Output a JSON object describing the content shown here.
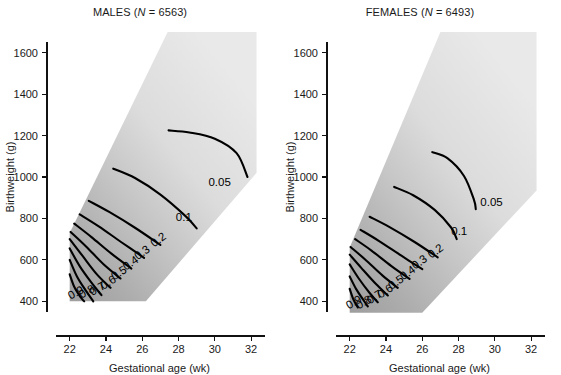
{
  "figure": {
    "background_color": "#ffffff",
    "contour_color": "#000000",
    "axis_color": "#111111"
  },
  "chart_data": [
    {
      "type": "line",
      "title": "MALES (N = 6563)",
      "title_prefix": "MALES (",
      "title_italic": "N",
      "title_suffix": " = 6563)",
      "group": "MALES",
      "n": 6563,
      "xlabel": "Gestational age (wk)",
      "ylabel": "Birthweight (g)",
      "xlim": [
        21.3,
        32.6
      ],
      "ylim": [
        300,
        1700
      ],
      "xticks": [
        22,
        24,
        26,
        28,
        30,
        32
      ],
      "yticks": [
        400,
        600,
        800,
        1000,
        1200,
        1400,
        1600
      ],
      "xticklabels": [
        "22",
        "24",
        "26",
        "28",
        "30",
        "32"
      ],
      "yticklabels": [
        "400",
        "600",
        "800",
        "1000",
        "1200",
        "1400",
        "1600"
      ],
      "grid": false,
      "legend": "none",
      "band_fill": "gradient-gray",
      "band_polygon": [
        [
          22.0,
          400
        ],
        [
          22.0,
          730
        ],
        [
          27.4,
          1700
        ],
        [
          32.3,
          1700
        ],
        [
          32.3,
          1020
        ],
        [
          26.2,
          400
        ]
      ],
      "series": [
        {
          "name": "0.9",
          "label": "0.9",
          "label_x": 22.05,
          "label_y": 408,
          "label_rotation": -28,
          "points": [
            [
              22.0,
              530
            ],
            [
              22.25,
              470
            ],
            [
              22.6,
              420
            ],
            [
              22.8,
              400
            ]
          ]
        },
        {
          "name": "0.8",
          "label": "0.8",
          "label_x": 22.65,
          "label_y": 412,
          "label_rotation": -28,
          "points": [
            [
              22.0,
              600
            ],
            [
              22.4,
              520
            ],
            [
              22.9,
              450
            ],
            [
              23.3,
              400
            ]
          ]
        },
        {
          "name": "0.7",
          "label": "0.7",
          "label_x": 23.25,
          "label_y": 425,
          "label_rotation": -30,
          "points": [
            [
              22.0,
              655
            ],
            [
              22.55,
              570
            ],
            [
              23.2,
              490
            ],
            [
              23.75,
              430
            ]
          ]
        },
        {
          "name": "0.6",
          "label": "0.6",
          "label_x": 23.85,
          "label_y": 455,
          "label_rotation": -32,
          "points": [
            [
              22.0,
              700
            ],
            [
              22.7,
              620
            ],
            [
              23.5,
              530
            ],
            [
              24.25,
              465
            ]
          ]
        },
        {
          "name": "0.5",
          "label": "0.5",
          "label_x": 24.45,
          "label_y": 500,
          "label_rotation": -33,
          "points": [
            [
              22.05,
              735
            ],
            [
              22.9,
              665
            ],
            [
              23.85,
              580
            ],
            [
              24.8,
              510
            ]
          ]
        },
        {
          "name": "0.4",
          "label": "0.4",
          "label_x": 25.1,
          "label_y": 548,
          "label_rotation": -34,
          "points": [
            [
              22.25,
              775
            ],
            [
              23.2,
              710
            ],
            [
              24.3,
              630
            ],
            [
              25.4,
              558
            ]
          ]
        },
        {
          "name": "0.3",
          "label": "0.3",
          "label_x": 25.75,
          "label_y": 598,
          "label_rotation": -35,
          "points": [
            [
              22.55,
              820
            ],
            [
              23.6,
              762
            ],
            [
              24.85,
              685
            ],
            [
              26.1,
              610
            ]
          ]
        },
        {
          "name": "0.2",
          "label": "0.2",
          "label_x": 26.65,
          "label_y": 660,
          "label_rotation": -36,
          "points": [
            [
              23.05,
              885
            ],
            [
              24.2,
              830
            ],
            [
              25.6,
              755
            ],
            [
              27.0,
              672
            ]
          ]
        },
        {
          "name": "0.1",
          "label": "0.1",
          "label_x": 27.85,
          "label_y": 790,
          "label_rotation": 0,
          "points": [
            [
              24.4,
              1040
            ],
            [
              25.6,
              995
            ],
            [
              27.0,
              915
            ],
            [
              28.4,
              810
            ],
            [
              29.0,
              752
            ]
          ]
        },
        {
          "name": "0.05",
          "label": "0.05",
          "label_x": 29.65,
          "label_y": 955,
          "label_rotation": 0,
          "points": [
            [
              27.45,
              1225
            ],
            [
              28.6,
              1215
            ],
            [
              30.0,
              1185
            ],
            [
              31.2,
              1115
            ],
            [
              31.8,
              1000
            ]
          ]
        }
      ]
    },
    {
      "type": "line",
      "title": "FEMALES (N = 6493)",
      "title_prefix": "FEMALES (",
      "title_italic": "N",
      "title_suffix": " = 6493)",
      "group": "FEMALES",
      "n": 6493,
      "xlabel": "Gestational age (wk)",
      "ylabel": "Birthweight (g)",
      "xlim": [
        21.3,
        32.6
      ],
      "ylim": [
        300,
        1700
      ],
      "xticks": [
        22,
        24,
        26,
        28,
        30,
        32
      ],
      "yticks": [
        400,
        600,
        800,
        1000,
        1200,
        1400,
        1600
      ],
      "xticklabels": [
        "22",
        "24",
        "26",
        "28",
        "30",
        "32"
      ],
      "yticklabels": [
        "400",
        "600",
        "800",
        "1000",
        "1200",
        "1400",
        "1600"
      ],
      "grid": false,
      "legend": "none",
      "band_fill": "gradient-gray",
      "band_polygon": [
        [
          22.0,
          345
        ],
        [
          22.0,
          660
        ],
        [
          27.0,
          1700
        ],
        [
          32.3,
          1700
        ],
        [
          32.3,
          935
        ],
        [
          26.0,
          345
        ]
      ],
      "series": [
        {
          "name": "0.9",
          "label": "0.9",
          "label_x": 21.95,
          "label_y": 360,
          "label_rotation": -30,
          "points": [
            [
              22.0,
              460
            ],
            [
              22.2,
              410
            ],
            [
              22.45,
              370
            ]
          ]
        },
        {
          "name": "0.8",
          "label": "0.8",
          "label_x": 22.5,
          "label_y": 360,
          "label_rotation": -30,
          "points": [
            [
              22.0,
              520
            ],
            [
              22.35,
              460
            ],
            [
              22.8,
              400
            ],
            [
              23.0,
              375
            ]
          ]
        },
        {
          "name": "0.7",
          "label": "0.7",
          "label_x": 23.1,
          "label_y": 385,
          "label_rotation": -32,
          "points": [
            [
              22.0,
              578
            ],
            [
              22.5,
              510
            ],
            [
              23.1,
              440
            ],
            [
              23.55,
              395
            ]
          ]
        },
        {
          "name": "0.6",
          "label": "0.6",
          "label_x": 23.7,
          "label_y": 412,
          "label_rotation": -33,
          "points": [
            [
              22.0,
              625
            ],
            [
              22.65,
              560
            ],
            [
              23.45,
              483
            ],
            [
              24.1,
              428
            ]
          ]
        },
        {
          "name": "0.5",
          "label": "0.5",
          "label_x": 24.3,
          "label_y": 455,
          "label_rotation": -34,
          "points": [
            [
              22.05,
              662
            ],
            [
              22.85,
              602
            ],
            [
              23.8,
              525
            ],
            [
              24.65,
              465
            ]
          ]
        },
        {
          "name": "0.4",
          "label": "0.4",
          "label_x": 24.95,
          "label_y": 500,
          "label_rotation": -35,
          "points": [
            [
              22.3,
              700
            ],
            [
              23.2,
              645
            ],
            [
              24.3,
              570
            ],
            [
              25.3,
              508
            ]
          ]
        },
        {
          "name": "0.3",
          "label": "0.3",
          "label_x": 25.6,
          "label_y": 552,
          "label_rotation": -35,
          "points": [
            [
              22.6,
              745
            ],
            [
              23.6,
              692
            ],
            [
              24.85,
              620
            ],
            [
              26.0,
              555
            ]
          ]
        },
        {
          "name": "0.2",
          "label": "0.2",
          "label_x": 26.5,
          "label_y": 605,
          "label_rotation": -36,
          "points": [
            [
              23.1,
              808
            ],
            [
              24.2,
              758
            ],
            [
              25.6,
              685
            ],
            [
              26.85,
              612
            ]
          ]
        },
        {
          "name": "0.1",
          "label": "0.1",
          "label_x": 27.6,
          "label_y": 720,
          "label_rotation": 0,
          "points": [
            [
              24.45,
              952
            ],
            [
              25.5,
              912
            ],
            [
              26.7,
              840
            ],
            [
              27.6,
              755
            ],
            [
              27.9,
              700
            ]
          ]
        },
        {
          "name": "0.05",
          "label": "0.05",
          "label_x": 29.2,
          "label_y": 862,
          "label_rotation": 0,
          "points": [
            [
              26.55,
              1120
            ],
            [
              27.4,
              1090
            ],
            [
              28.3,
              1005
            ],
            [
              28.85,
              890
            ],
            [
              28.95,
              845
            ]
          ]
        }
      ]
    }
  ]
}
